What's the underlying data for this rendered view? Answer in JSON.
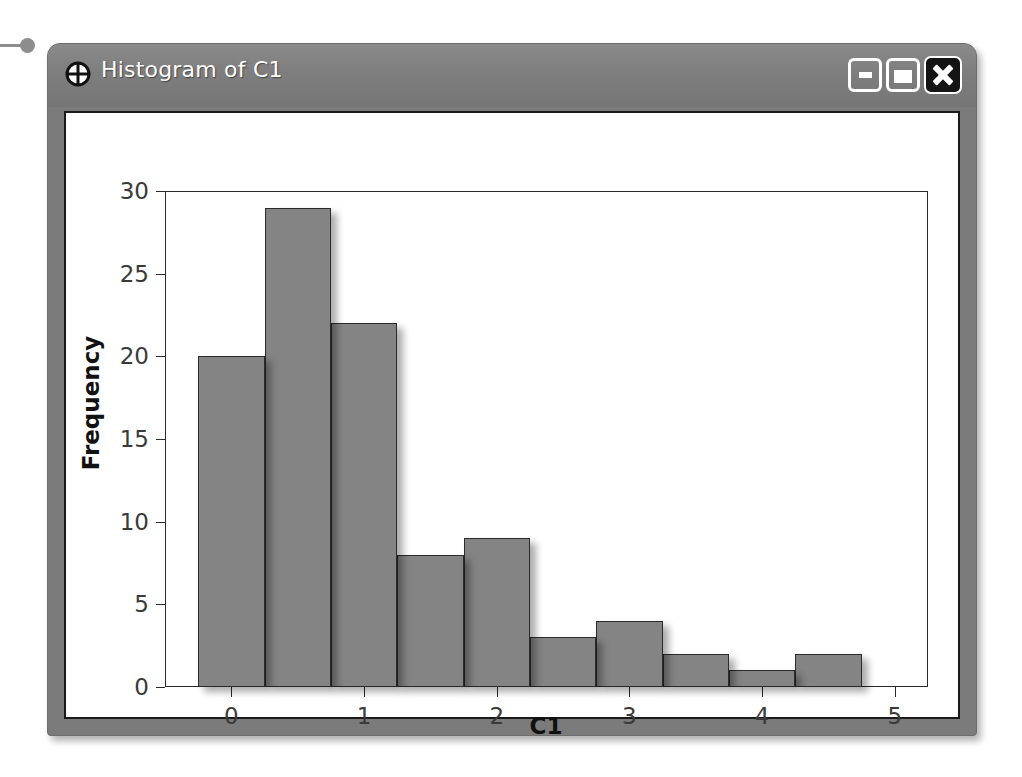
{
  "window": {
    "title": "Histogram of C1",
    "icon": "crosshair-circle-icon",
    "controls": {
      "minimize_label": "",
      "maximize_label": "",
      "close_label": ""
    },
    "titlebar_color": "#7e7e7e",
    "frame_color": "#7b7b7b",
    "client_background": "#ffffff"
  },
  "chart_data": {
    "type": "bar",
    "title": "Histogram of C1",
    "xlabel": "C1",
    "ylabel": "Frequency",
    "bin_width": 0.5,
    "bin_starts": [
      -0.25,
      0.25,
      0.75,
      1.25,
      1.75,
      2.25,
      2.75,
      3.25,
      3.75,
      4.25
    ],
    "bin_centers": [
      0.0,
      0.5,
      1.0,
      1.5,
      2.0,
      2.5,
      3.0,
      3.5,
      4.0,
      4.5
    ],
    "categories": [
      "0.0",
      "0.5",
      "1.0",
      "1.5",
      "2.0",
      "2.5",
      "3.0",
      "3.5",
      "4.0",
      "4.5"
    ],
    "values": [
      20,
      29,
      22,
      8,
      9,
      3,
      4,
      2,
      1,
      2
    ],
    "xlim": [
      -0.5,
      5.25
    ],
    "ylim": [
      0,
      30
    ],
    "xticks": [
      0,
      1,
      2,
      3,
      4,
      5
    ],
    "xtick_labels": [
      "0",
      "1",
      "2",
      "3",
      "4",
      "5"
    ],
    "yticks": [
      0,
      5,
      10,
      15,
      20,
      25,
      30
    ],
    "ytick_labels": [
      "0",
      "5",
      "10",
      "15",
      "20",
      "25",
      "30"
    ],
    "grid": false,
    "legend": null,
    "bar_fill_color": "#848484",
    "bar_edge_color": "#2b2b2b"
  }
}
